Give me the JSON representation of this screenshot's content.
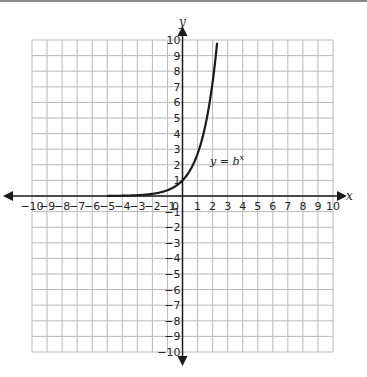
{
  "chart_data": {
    "type": "line",
    "title": "",
    "xlabel": "x",
    "ylabel": "y",
    "xlim": [
      -10,
      10
    ],
    "ylim": [
      -10,
      10
    ],
    "grid": true,
    "x_ticks": [
      -10,
      -9,
      -8,
      -7,
      -6,
      -5,
      -4,
      -3,
      -2,
      -1,
      0,
      1,
      2,
      3,
      4,
      5,
      6,
      7,
      8,
      9,
      10
    ],
    "y_ticks": [
      -10,
      -9,
      -8,
      -7,
      -6,
      -5,
      -4,
      -3,
      -2,
      -1,
      1,
      2,
      3,
      4,
      5,
      6,
      7,
      8,
      9,
      10
    ],
    "series": [
      {
        "name": "y = b^x",
        "function": "exponential",
        "b_estimate": 2.7,
        "x_range": [
          -5,
          2.33
        ],
        "points": [
          [
            -5,
            0.01
          ],
          [
            -4,
            0.02
          ],
          [
            -3,
            0.05
          ],
          [
            -2,
            0.14
          ],
          [
            -1,
            0.37
          ],
          [
            0,
            1
          ],
          [
            1,
            2.7
          ],
          [
            2,
            7.3
          ],
          [
            2.33,
            10
          ]
        ]
      }
    ],
    "annotations": [
      {
        "text_main": "y = b",
        "text_sup": "x",
        "x": 2.3,
        "y": 2.3
      }
    ],
    "colors": {
      "grid": "#b9b9b9",
      "axis": "#1a1a1a",
      "curve": "#1a1a1a"
    }
  },
  "labels": {
    "x_axis": "x",
    "y_axis": "y",
    "curve_main": "y = b",
    "curve_sup": "x",
    "origin": "0"
  }
}
